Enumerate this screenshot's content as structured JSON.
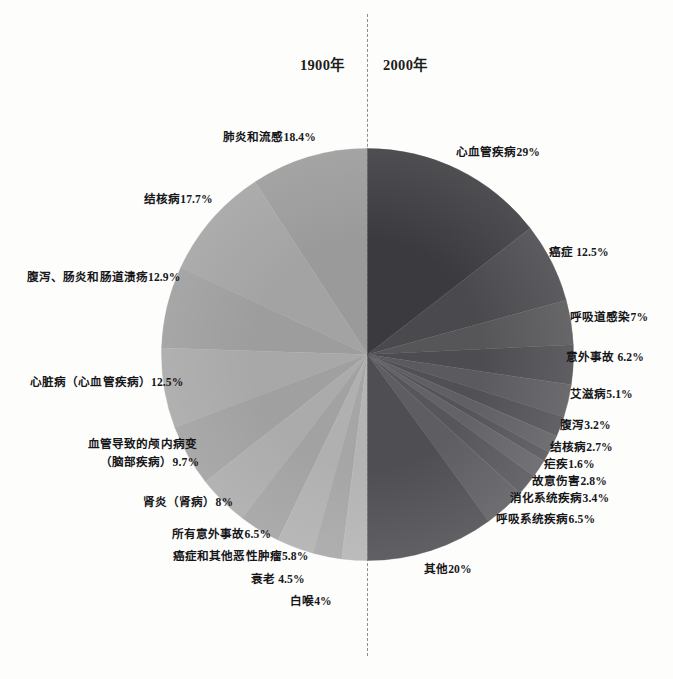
{
  "header": {
    "left_year": "1900年",
    "right_year": "2000年"
  },
  "divider": {
    "style": "dashed-vertical"
  },
  "chart_data": {
    "type": "pie",
    "title": "",
    "subtitle": "",
    "layout": "back-to-back semicircular pie comparison",
    "legend_position": "outside-labels",
    "grid": false,
    "series": [
      {
        "name": "1900年",
        "side": "left",
        "half_span_degrees": 180,
        "total": 100,
        "color_family": "light-gray",
        "slices": [
          {
            "label": "肺炎和流感18.4%",
            "name": "肺炎和流感",
            "value": 18.4,
            "color": "#9a9a9a"
          },
          {
            "label": "结核病17.7%",
            "name": "结核病",
            "value": 17.7,
            "color": "#a3a3a3"
          },
          {
            "label": "腹泻、肠炎和肠道溃疡12.9%",
            "name": "腹泻、肠炎和肠道溃疡",
            "value": 12.9,
            "color": "#9d9d9d"
          },
          {
            "label": "心脏病（心血管疾病）12.5%",
            "name": "心脏病（心血管疾病）",
            "value": 12.5,
            "color": "#a8a8a8"
          },
          {
            "label": "血管导致的颅内病变（脑部疾病）9.7%",
            "name": "血管导致的颅内病变（脑部疾病）",
            "value": 9.7,
            "color": "#a0a0a0"
          },
          {
            "label": "肾炎（肾病）8%",
            "name": "肾炎（肾病）",
            "value": 8,
            "color": "#ababab"
          },
          {
            "label": "所有意外事故6.5%",
            "name": "所有意外事故",
            "value": 6.5,
            "color": "#a2a2a2"
          },
          {
            "label": "癌症和其他恶性肿瘤5.8%",
            "name": "癌症和其他恶性肿瘤",
            "value": 5.8,
            "color": "#b0b0b0"
          },
          {
            "label": "衰老 4.5%",
            "name": "衰老",
            "value": 4.5,
            "color": "#a6a6a6"
          },
          {
            "label": "白喉4%",
            "name": "白喉",
            "value": 4,
            "color": "#b4b4b4"
          }
        ]
      },
      {
        "name": "2000年",
        "side": "right",
        "half_span_degrees": 180,
        "total": 100,
        "color_family": "dark-gray",
        "slices": [
          {
            "label": "心血管疾病29%",
            "name": "心血管疾病",
            "value": 29,
            "color": "#3b3b3f"
          },
          {
            "label": "癌症 12.5%",
            "name": "癌症",
            "value": 12.5,
            "color": "#4a4a4e"
          },
          {
            "label": "呼吸道感染7%",
            "name": "呼吸道感染",
            "value": 7,
            "color": "#565659"
          },
          {
            "label": "意外事故 6.2%",
            "name": "意外事故",
            "value": 6.2,
            "color": "#4d4d51"
          },
          {
            "label": "艾滋病5.1%",
            "name": "艾滋病",
            "value": 5.1,
            "color": "#5b5b5f"
          },
          {
            "label": "腹泻3.2%",
            "name": "腹泻",
            "value": 3.2,
            "color": "#515155"
          },
          {
            "label": "结核病2.7%",
            "name": "结核病",
            "value": 2.7,
            "color": "#606064"
          },
          {
            "label": "疟疾1.6%",
            "name": "疟疾",
            "value": 1.6,
            "color": "#555559"
          },
          {
            "label": "故意伤害2.8%",
            "name": "故意伤害",
            "value": 2.8,
            "color": "#636367"
          },
          {
            "label": "消化系统疾病3.4%",
            "name": "消化系统疾病",
            "value": 3.4,
            "color": "#57575b"
          },
          {
            "label": "呼吸系统疾病6.5%",
            "name": "呼吸系统疾病",
            "value": 6.5,
            "color": "#5e5e62"
          },
          {
            "label": "其他20%",
            "name": "其他",
            "value": 20,
            "color": "#4f4f53"
          }
        ]
      }
    ]
  },
  "labels": {
    "left": [
      {
        "text": "肺炎和流感18.4%",
        "x": 223,
        "y": 130,
        "align": "left"
      },
      {
        "text": "结核病17.7%",
        "x": 144,
        "y": 192,
        "align": "left"
      },
      {
        "text": "腹泻、肠炎和肠道溃疡12.9%",
        "x": 27,
        "y": 270,
        "align": "left"
      },
      {
        "text": "心脏病（心血管疾病）12.5%",
        "x": 30,
        "y": 375,
        "align": "left"
      },
      {
        "text": "血管导致的颅内病变",
        "x": 88,
        "y": 437,
        "align": "left"
      },
      {
        "text": "（脑部疾病）9.7%",
        "x": 100,
        "y": 455,
        "align": "left"
      },
      {
        "text": "肾炎（肾病）8%",
        "x": 143,
        "y": 495,
        "align": "left"
      },
      {
        "text": "所有意外事故6.5%",
        "x": 172,
        "y": 527,
        "align": "left"
      },
      {
        "text": "癌症和其他恶性肿瘤5.8%",
        "x": 173,
        "y": 549,
        "align": "left"
      },
      {
        "text": "衰老 4.5%",
        "x": 251,
        "y": 572,
        "align": "left"
      },
      {
        "text": "白喉4%",
        "x": 290,
        "y": 594,
        "align": "left"
      }
    ],
    "right": [
      {
        "text": "心血管疾病29%",
        "x": 456,
        "y": 145,
        "align": "left"
      },
      {
        "text": "癌症 12.5%",
        "x": 549,
        "y": 245,
        "align": "left"
      },
      {
        "text": "呼吸道感染7%",
        "x": 570,
        "y": 310,
        "align": "left"
      },
      {
        "text": "意外事故 6.2%",
        "x": 566,
        "y": 350,
        "align": "left"
      },
      {
        "text": "艾滋病5.1%",
        "x": 570,
        "y": 387,
        "align": "left"
      },
      {
        "text": "腹泻3.2%",
        "x": 560,
        "y": 418,
        "align": "left"
      },
      {
        "text": "结核病2.7%",
        "x": 550,
        "y": 440,
        "align": "left"
      },
      {
        "text": "疟疾1.6%",
        "x": 544,
        "y": 457,
        "align": "left"
      },
      {
        "text": "故意伤害2.8%",
        "x": 532,
        "y": 474,
        "align": "left"
      },
      {
        "text": "消化系统疾病3.4%",
        "x": 510,
        "y": 491,
        "align": "left"
      },
      {
        "text": "呼吸系统疾病6.5%",
        "x": 496,
        "y": 512,
        "align": "left"
      },
      {
        "text": "其他20%",
        "x": 424,
        "y": 562,
        "align": "left"
      }
    ]
  },
  "geometry": {
    "center_x": 367.5,
    "center_y": 354.5,
    "radius": 206
  }
}
